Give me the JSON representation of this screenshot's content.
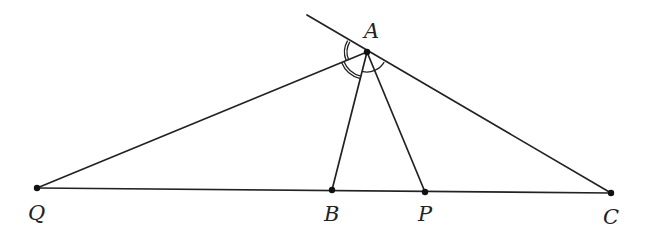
{
  "diagram": {
    "type": "geometry",
    "points": {
      "A": {
        "label": "A",
        "x": 367,
        "y": 52
      },
      "Q": {
        "label": "Q",
        "x": 37,
        "y": 188
      },
      "B": {
        "label": "B",
        "x": 332,
        "y": 190
      },
      "P": {
        "label": "P",
        "x": 425,
        "y": 192
      },
      "C": {
        "label": "C",
        "x": 611,
        "y": 193
      }
    },
    "segments": [
      "QC",
      "AQ",
      "AB",
      "AP",
      "AC",
      "extension of CA beyond A"
    ],
    "angle_marks": [
      {
        "vertex": "A",
        "between": [
          "extension",
          "AQ"
        ],
        "style": "double arc"
      },
      {
        "vertex": "A",
        "between": [
          "AQ",
          "AB"
        ],
        "style": "double arc"
      },
      {
        "vertex": "A",
        "between": [
          "AB",
          "AC"
        ],
        "style": "single arc"
      }
    ],
    "colors": {
      "stroke": "#222222",
      "background": "#ffffff"
    }
  }
}
